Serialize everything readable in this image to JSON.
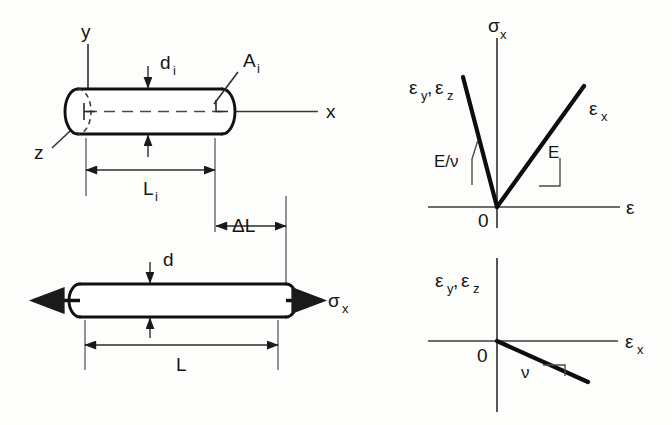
{
  "figure": {
    "background_color": "#fdfdfb",
    "line_color": "#111111",
    "axis_color": "#3a3a3a"
  },
  "panel_undeformed": {
    "name": "Undeformed cylindrical bar with coordinate axes",
    "axis_y_label": "y",
    "axis_x_label": "x",
    "axis_z_label": "z",
    "diameter_label": "d",
    "diameter_sub": "i",
    "area_label": "A",
    "area_sub": "i",
    "length_label": "L",
    "length_sub": "i",
    "cylinder": {
      "left_x": 78,
      "right_x": 222,
      "top_y": 89,
      "bottom_y": 134,
      "cap_rx": 13,
      "axis_y": 111.5
    }
  },
  "panel_deformed": {
    "name": "Deformed bar elongated under axial stress",
    "elongation_label": "ΔL",
    "diameter_label": "d",
    "length_label": "L",
    "stress_label": "σ",
    "stress_sub": "x",
    "cylinder": {
      "left_x": 80,
      "right_x": 286,
      "top_y": 284,
      "bottom_y": 317,
      "cap_rx": 11,
      "axis_y": 300.5
    }
  },
  "chart_upper": {
    "type": "line",
    "name": "Axial stress versus strain",
    "ylabel": "σ",
    "ylabel_sub": "x",
    "xlabel": "ε",
    "origin_label": "0",
    "series": [
      {
        "name": "ε_x",
        "label": "ε",
        "label_sub": "x",
        "slope_label": "E",
        "description": "positive axial strain branch, slope E",
        "points": [
          [
            0,
            0
          ],
          [
            0.86,
            1.0
          ]
        ]
      },
      {
        "name": "ε_y, ε_z",
        "label": "ε",
        "label_sub": "y",
        "label2": "ε",
        "label2_sub": "z",
        "slope_label": "E/ν",
        "description": "negative transverse strain branch, slope E/ν (steeper)",
        "points": [
          [
            0,
            0
          ],
          [
            -0.33,
            1.08
          ]
        ]
      }
    ],
    "axis_ranges": {
      "x": [
        -0.72,
        1.25
      ],
      "y": [
        -0.12,
        1.25
      ]
    },
    "grid": false,
    "legend": "none"
  },
  "chart_lower": {
    "type": "line",
    "name": "Transverse strain versus axial strain",
    "ylabel": "ε",
    "ylabel_sub": "y",
    "ylabel2": "ε",
    "ylabel2_sub": "z",
    "xlabel": "ε",
    "xlabel_sub": "x",
    "origin_label": "0",
    "series": [
      {
        "name": "poisson-line",
        "slope_label": "ν",
        "description": "straight line of negative slope −ν through origin",
        "points": [
          [
            0,
            0
          ],
          [
            1.0,
            -0.3
          ]
        ]
      }
    ],
    "axis_ranges": {
      "x": [
        -0.6,
        1.35
      ],
      "y": [
        -0.6,
        0.95
      ]
    },
    "grid": false,
    "legend": "none"
  }
}
